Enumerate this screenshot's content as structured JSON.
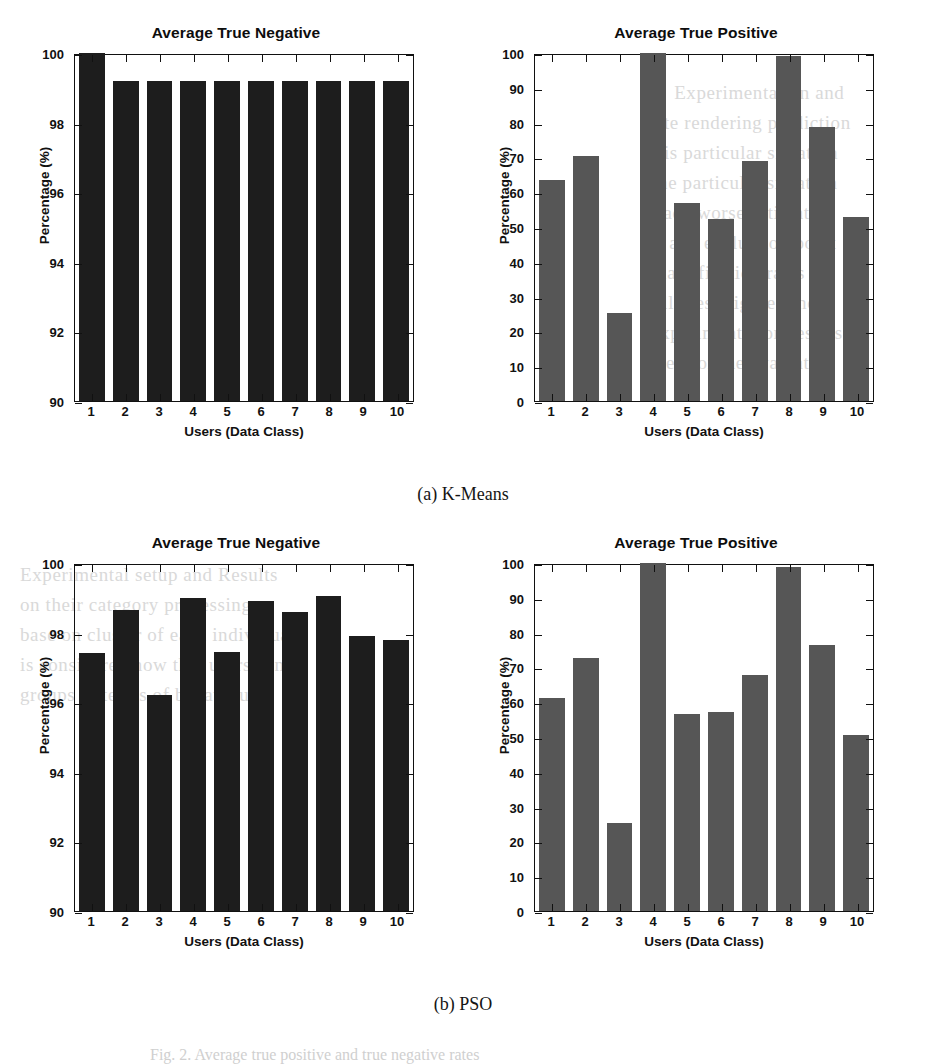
{
  "document": {
    "figure_caption": "Fig. 2.  Average true positive and true negative rates",
    "bleed_text_right": [
      "1   Experimentation and",
      "rate rendering prediction",
      "this particular situation",
      "one particular situation",
      "made worse estimates",
      "to any evaluation point",
      "Classification rates for",
      "All these figures show",
      "Experimentation results",
      "used for the evaluation"
    ],
    "bleed_text_left": [
      "Experimental setup and Results",
      "on their category processing.",
      "base on cluster of each individual",
      "is considered now that users can",
      "groups in terms of behaviour"
    ]
  },
  "subfigures": [
    {
      "id": "a",
      "caption": "(a) K-Means"
    },
    {
      "id": "b",
      "caption": "(b) PSO"
    }
  ],
  "chart_data": [
    {
      "type": "bar",
      "panel": "a-left",
      "title": "Average True Negative",
      "xlabel": "Users (Data Class)",
      "ylabel": "Percentage (%)",
      "categories": [
        "1",
        "2",
        "3",
        "4",
        "5",
        "6",
        "7",
        "8",
        "9",
        "10"
      ],
      "values": [
        100,
        99.2,
        99.2,
        99.2,
        99.2,
        99.2,
        99.2,
        99.2,
        99.2,
        99.2
      ],
      "ylim": [
        90,
        100
      ],
      "yticks": [
        90,
        92,
        94,
        96,
        98,
        100
      ],
      "grid": false,
      "legend": "none",
      "bar_color": "#1d1d1d"
    },
    {
      "type": "bar",
      "panel": "a-right",
      "title": "Average True Positive",
      "xlabel": "Users (Data Class)",
      "ylabel": "Percentage (%)",
      "categories": [
        "1",
        "2",
        "3",
        "4",
        "5",
        "6",
        "7",
        "8",
        "9",
        "10"
      ],
      "values": [
        63.6,
        70.4,
        25.3,
        100,
        57.0,
        52.2,
        69.0,
        99.0,
        78.6,
        53.0
      ],
      "ylim": [
        0,
        100
      ],
      "yticks": [
        0,
        10,
        20,
        30,
        40,
        50,
        60,
        70,
        80,
        90,
        100
      ],
      "grid": false,
      "legend": "none",
      "bar_color": "#565656"
    },
    {
      "type": "bar",
      "panel": "b-left",
      "title": "Average True Negative",
      "xlabel": "Users (Data Class)",
      "ylabel": "Percentage (%)",
      "categories": [
        "1",
        "2",
        "3",
        "4",
        "5",
        "6",
        "7",
        "8",
        "9",
        "10"
      ],
      "values": [
        97.4,
        98.65,
        96.2,
        99.0,
        97.45,
        98.9,
        98.6,
        99.05,
        97.9,
        97.8
      ],
      "ylim": [
        90,
        100
      ],
      "yticks": [
        90,
        92,
        94,
        96,
        98,
        100
      ],
      "grid": false,
      "legend": "none",
      "bar_color": "#1d1d1d"
    },
    {
      "type": "bar",
      "panel": "b-right",
      "title": "Average True Positive",
      "xlabel": "Users (Data Class)",
      "ylabel": "Percentage (%)",
      "categories": [
        "1",
        "2",
        "3",
        "4",
        "5",
        "6",
        "7",
        "8",
        "9",
        "10"
      ],
      "values": [
        61.3,
        72.8,
        25.2,
        100,
        56.7,
        57.3,
        67.8,
        98.8,
        76.5,
        50.6
      ],
      "ylim": [
        0,
        100
      ],
      "yticks": [
        0,
        10,
        20,
        30,
        40,
        50,
        60,
        70,
        80,
        90,
        100
      ],
      "grid": false,
      "legend": "none",
      "bar_color": "#565656"
    }
  ]
}
